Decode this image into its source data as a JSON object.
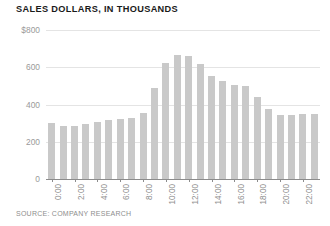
{
  "chart_data": {
    "type": "bar",
    "title": "SALES DOLLARS, IN THOUSANDS",
    "source": "SOURCE: COMPANY RESEARCH",
    "xlabel": "",
    "ylabel": "",
    "ylim": [
      0,
      800
    ],
    "grid": true,
    "legend": null,
    "bar_color": "#c9c9c9",
    "y_ticks": [
      {
        "value": 800,
        "label": "$800"
      },
      {
        "value": 600,
        "label": "600"
      },
      {
        "value": 400,
        "label": "400"
      },
      {
        "value": 200,
        "label": "200"
      },
      {
        "value": 0,
        "label": "0"
      }
    ],
    "x_tick_labels": [
      "0:00",
      "2:00",
      "4:00",
      "6:00",
      "8:00",
      "10:00",
      "12:00",
      "14:00",
      "16:00",
      "18:00",
      "20:00",
      "22:00"
    ],
    "x_tick_every": 2,
    "categories": [
      "0:00",
      "1:00",
      "2:00",
      "3:00",
      "4:00",
      "5:00",
      "6:00",
      "7:00",
      "8:00",
      "9:00",
      "10:00",
      "11:00",
      "12:00",
      "13:00",
      "14:00",
      "15:00",
      "16:00",
      "17:00",
      "18:00",
      "19:00",
      "20:00",
      "21:00",
      "22:00",
      "23:00"
    ],
    "values": [
      300,
      285,
      285,
      295,
      305,
      315,
      320,
      330,
      355,
      490,
      625,
      665,
      660,
      615,
      555,
      525,
      505,
      500,
      440,
      375,
      345,
      345,
      350,
      350
    ]
  }
}
